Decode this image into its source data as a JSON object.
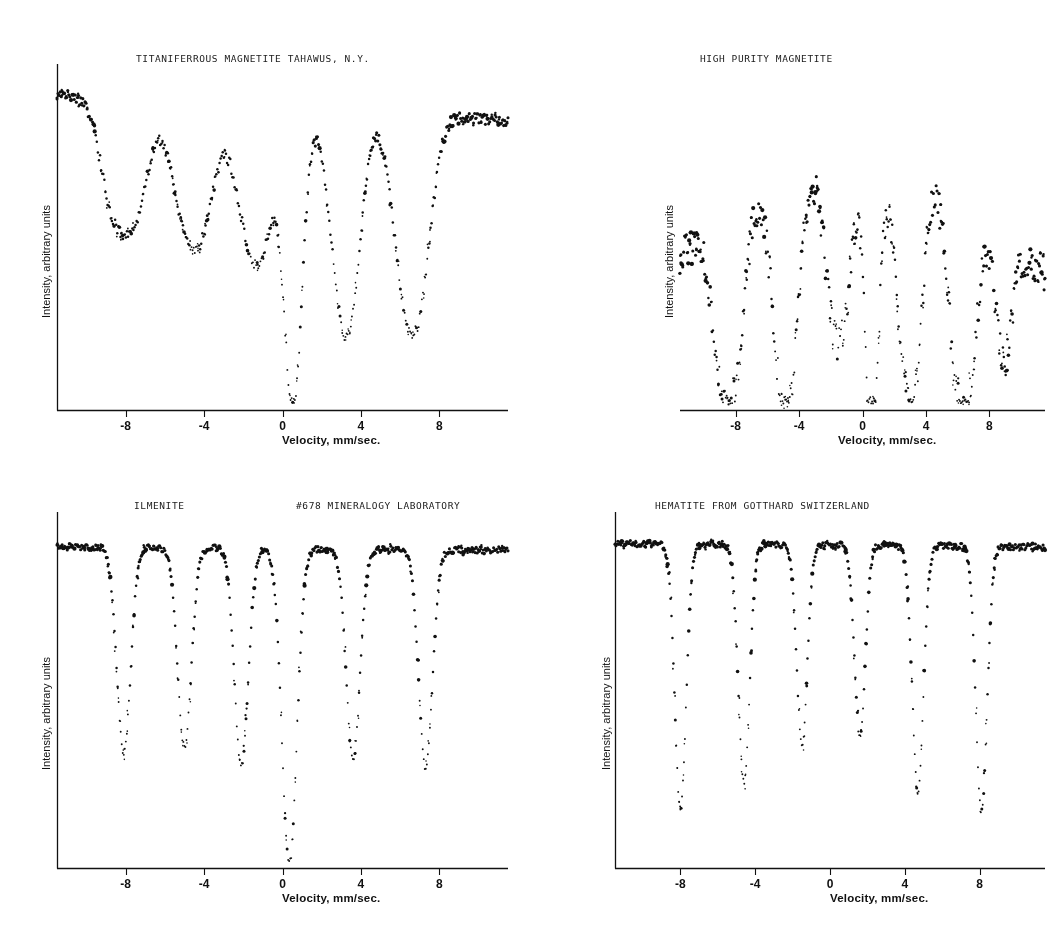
{
  "figure": {
    "width": 1059,
    "height": 932,
    "background": "#ffffff",
    "ink": "#111111"
  },
  "axis": {
    "xlabel": "Velocity,  mm/sec.",
    "ylabel": "Intensity, arbitrary units",
    "ticks": [
      {
        "value": -8,
        "label": "-8"
      },
      {
        "value": -4,
        "label": "-4"
      },
      {
        "value": 0,
        "label": "0"
      },
      {
        "value": 4,
        "label": "4"
      },
      {
        "value": 8,
        "label": "8"
      }
    ],
    "xlim": [
      -11.5,
      11.5
    ]
  },
  "chart_data": [
    {
      "id": "titaniferous-magnetite",
      "type": "scatter",
      "title": "TITANIFERROUS MAGNETITE TAHAWUS, N.Y.",
      "subtitle": "",
      "xlabel": "Velocity,  mm/sec.",
      "ylabel": "Intensity, arbitrary units",
      "xlim": [
        -11.5,
        11.5
      ],
      "ylim": [
        0,
        1
      ],
      "grid": false,
      "legend": null,
      "baseline_left": 0.98,
      "baseline_right": 0.9,
      "baseline_tilt": -0.085,
      "noise": 0.018,
      "n_points": 420,
      "peaks": [
        {
          "center": -8.6,
          "depth": 0.34,
          "width": 0.8
        },
        {
          "center": -7.4,
          "depth": 0.3,
          "width": 0.75
        },
        {
          "center": -5.0,
          "depth": 0.32,
          "width": 0.85
        },
        {
          "center": -4.0,
          "depth": 0.28,
          "width": 0.8
        },
        {
          "center": -1.8,
          "depth": 0.33,
          "width": 0.8
        },
        {
          "center": -0.9,
          "depth": 0.3,
          "width": 0.75
        },
        {
          "center": 0.55,
          "depth": 0.92,
          "width": 0.55
        },
        {
          "center": 2.9,
          "depth": 0.46,
          "width": 0.7
        },
        {
          "center": 3.6,
          "depth": 0.4,
          "width": 0.65
        },
        {
          "center": 6.2,
          "depth": 0.48,
          "width": 0.75
        },
        {
          "center": 7.1,
          "depth": 0.42,
          "width": 0.7
        }
      ],
      "axes": {
        "left_spine": true,
        "bottom_spine": true
      }
    },
    {
      "id": "high-purity-magnetite",
      "type": "scatter",
      "title": "HIGH PURITY MAGNETITE",
      "subtitle": "",
      "xlabel": "Velocity,  mm/sec.",
      "ylabel": "Intensity, arbitrary units",
      "xlim": [
        -11.5,
        11.5
      ],
      "ylim": [
        0,
        1
      ],
      "grid": false,
      "legend": null,
      "baseline_left": 0.52,
      "baseline_right": 0.47,
      "baseline_tilt": -0.04,
      "noise": 0.055,
      "n_points": 400,
      "arch": 0.3,
      "peaks": [
        {
          "center": -8.9,
          "depth": 0.46,
          "width": 0.65
        },
        {
          "center": -7.9,
          "depth": 0.42,
          "width": 0.6
        },
        {
          "center": -5.2,
          "depth": 0.5,
          "width": 0.65
        },
        {
          "center": -4.4,
          "depth": 0.44,
          "width": 0.6
        },
        {
          "center": -1.9,
          "depth": 0.4,
          "width": 0.6
        },
        {
          "center": -1.1,
          "depth": 0.36,
          "width": 0.55
        },
        {
          "center": 0.6,
          "depth": 0.88,
          "width": 0.5
        },
        {
          "center": 2.6,
          "depth": 0.52,
          "width": 0.6
        },
        {
          "center": 3.4,
          "depth": 0.48,
          "width": 0.55
        },
        {
          "center": 5.9,
          "depth": 0.5,
          "width": 0.6
        },
        {
          "center": 6.8,
          "depth": 0.46,
          "width": 0.58
        },
        {
          "center": 8.9,
          "depth": 0.38,
          "width": 0.6
        }
      ],
      "axes": {
        "left_spine": false,
        "bottom_spine": true
      }
    },
    {
      "id": "ilmenite",
      "type": "scatter",
      "title": "ILMENITE",
      "subtitle": "#678 MINERALOGY LABORATORY",
      "xlabel": "Velocity,  mm/sec.",
      "ylabel": "Intensity, arbitrary units",
      "xlim": [
        -11.5,
        11.5
      ],
      "ylim": [
        0,
        1
      ],
      "grid": false,
      "legend": null,
      "baseline_left": 0.97,
      "baseline_right": 0.96,
      "baseline_tilt": -0.02,
      "noise": 0.01,
      "n_points": 440,
      "peaks": [
        {
          "center": -8.1,
          "depth": 0.62,
          "width": 0.42
        },
        {
          "center": -5.0,
          "depth": 0.6,
          "width": 0.42
        },
        {
          "center": -2.1,
          "depth": 0.66,
          "width": 0.42
        },
        {
          "center": 0.35,
          "depth": 0.96,
          "width": 0.45
        },
        {
          "center": 3.6,
          "depth": 0.64,
          "width": 0.42
        },
        {
          "center": 7.3,
          "depth": 0.66,
          "width": 0.42
        }
      ],
      "axes": {
        "left_spine": true,
        "bottom_spine": true
      }
    },
    {
      "id": "hematite-gotthard",
      "type": "scatter",
      "title": "HEMATITE FROM GOTTHARD SWITZERLAND",
      "subtitle": "",
      "xlabel": "Velocity,  mm/sec.",
      "ylabel": "Intensity, arbitrary units",
      "xlim": [
        -11.5,
        11.5
      ],
      "ylim": [
        0,
        1
      ],
      "grid": false,
      "legend": null,
      "baseline_left": 0.98,
      "baseline_right": 0.97,
      "baseline_tilt": -0.03,
      "noise": 0.01,
      "n_points": 450,
      "peaks": [
        {
          "center": -8.0,
          "depth": 0.8,
          "width": 0.36
        },
        {
          "center": -4.6,
          "depth": 0.72,
          "width": 0.36
        },
        {
          "center": -1.5,
          "depth": 0.6,
          "width": 0.34
        },
        {
          "center": 1.6,
          "depth": 0.58,
          "width": 0.34
        },
        {
          "center": 4.7,
          "depth": 0.74,
          "width": 0.36
        },
        {
          "center": 8.1,
          "depth": 0.8,
          "width": 0.36
        }
      ],
      "axes": {
        "left_spine": true,
        "bottom_spine": true
      }
    }
  ],
  "panels": [
    {
      "chart_index": 0,
      "left": 24,
      "top": 44,
      "width": 500,
      "height": 400,
      "plot": {
        "x0": 57,
        "y0": 64,
        "x1": 508,
        "y1": 410
      },
      "title_x": 136,
      "title_y": 53,
      "subtitle_x": 0,
      "subtitle_y": 0,
      "ylabel_x": 40,
      "ylabel_y": 318,
      "xlabel_x": 282,
      "xlabel_y": 434
    },
    {
      "chart_index": 1,
      "left": 590,
      "top": 44,
      "width": 460,
      "height": 400,
      "plot": {
        "x0": 680,
        "y0": 64,
        "x1": 1045,
        "y1": 410
      },
      "title_x": 700,
      "title_y": 53,
      "subtitle_x": 0,
      "subtitle_y": 0,
      "ylabel_x": 663,
      "ylabel_y": 318,
      "xlabel_x": 838,
      "xlabel_y": 434
    },
    {
      "chart_index": 2,
      "left": 24,
      "top": 490,
      "width": 500,
      "height": 400,
      "plot": {
        "x0": 57,
        "y0": 512,
        "x1": 508,
        "y1": 868
      },
      "title_x": 134,
      "title_y": 500,
      "subtitle_x": 296,
      "subtitle_y": 500,
      "ylabel_x": 40,
      "ylabel_y": 770,
      "xlabel_x": 282,
      "xlabel_y": 892
    },
    {
      "chart_index": 3,
      "left": 590,
      "top": 490,
      "width": 460,
      "height": 400,
      "plot": {
        "x0": 615,
        "y0": 512,
        "x1": 1045,
        "y1": 868
      },
      "title_x": 655,
      "title_y": 500,
      "subtitle_x": 0,
      "subtitle_y": 0,
      "ylabel_x": 600,
      "ylabel_y": 770,
      "xlabel_x": 830,
      "xlabel_y": 892
    }
  ]
}
